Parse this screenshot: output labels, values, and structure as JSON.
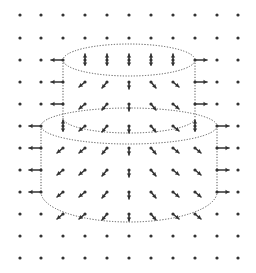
{
  "diagram": {
    "title": "",
    "colors": {
      "ink": "#333333",
      "outline": "#555555",
      "background": "#ffffff"
    },
    "grid": {
      "columns_x": [
        20,
        41,
        63,
        85,
        107,
        129,
        151,
        173,
        195,
        217,
        238
      ],
      "rows_y": [
        15,
        38,
        60,
        82,
        104,
        126,
        148,
        170,
        192,
        214,
        236,
        258
      ],
      "dot_radius": 1.6
    },
    "cylinders": [
      {
        "name": "upper-cylinder",
        "left_x": 63,
        "right_x": 195,
        "top_cy": 60,
        "top_ry": 16,
        "bottom_cy": 118,
        "bottom_ry": 15
      },
      {
        "name": "lower-cylinder",
        "left_x": 41,
        "right_x": 217,
        "top_cy": 126,
        "top_ry": 18,
        "bottom_cy": 192,
        "bottom_ry": 30
      }
    ],
    "arrows": [
      {
        "x": 63,
        "y": 60,
        "dx": -12,
        "dy": 0
      },
      {
        "x": 195,
        "y": 60,
        "dx": 12,
        "dy": 0
      },
      {
        "x": 85,
        "y": 60,
        "dx": 0,
        "dy": -6,
        "double": true
      },
      {
        "x": 107,
        "y": 60,
        "dx": 0,
        "dy": -6,
        "double": true
      },
      {
        "x": 129,
        "y": 60,
        "dx": 0,
        "dy": -6,
        "double": true
      },
      {
        "x": 151,
        "y": 60,
        "dx": 0,
        "dy": -6,
        "double": true
      },
      {
        "x": 173,
        "y": 60,
        "dx": 0,
        "dy": -6,
        "double": true
      },
      {
        "x": 63,
        "y": 82,
        "dx": -12,
        "dy": 0
      },
      {
        "x": 85,
        "y": 82,
        "dx": -6,
        "dy": 5
      },
      {
        "x": 107,
        "y": 82,
        "dx": -5,
        "dy": 6
      },
      {
        "x": 129,
        "y": 82,
        "dx": 0,
        "dy": 7
      },
      {
        "x": 151,
        "y": 82,
        "dx": 5,
        "dy": 6
      },
      {
        "x": 173,
        "y": 82,
        "dx": 6,
        "dy": 5
      },
      {
        "x": 195,
        "y": 82,
        "dx": 12,
        "dy": 0
      },
      {
        "x": 63,
        "y": 104,
        "dx": -12,
        "dy": 0
      },
      {
        "x": 85,
        "y": 104,
        "dx": -6,
        "dy": 5
      },
      {
        "x": 107,
        "y": 104,
        "dx": -5,
        "dy": 6
      },
      {
        "x": 129,
        "y": 104,
        "dx": 0,
        "dy": 7
      },
      {
        "x": 151,
        "y": 104,
        "dx": 5,
        "dy": 6
      },
      {
        "x": 173,
        "y": 104,
        "dx": 6,
        "dy": 5
      },
      {
        "x": 195,
        "y": 104,
        "dx": 12,
        "dy": 0
      },
      {
        "x": 41,
        "y": 126,
        "dx": -12,
        "dy": 0
      },
      {
        "x": 63,
        "y": 126,
        "dx": 0,
        "dy": -6,
        "double": true
      },
      {
        "x": 85,
        "y": 126,
        "dx": -6,
        "dy": 5
      },
      {
        "x": 107,
        "y": 126,
        "dx": -5,
        "dy": 6
      },
      {
        "x": 129,
        "y": 126,
        "dx": 0,
        "dy": 7
      },
      {
        "x": 151,
        "y": 126,
        "dx": 5,
        "dy": 6
      },
      {
        "x": 173,
        "y": 126,
        "dx": 6,
        "dy": 5
      },
      {
        "x": 195,
        "y": 126,
        "dx": 0,
        "dy": -6,
        "double": true
      },
      {
        "x": 217,
        "y": 126,
        "dx": 12,
        "dy": 0
      },
      {
        "x": 41,
        "y": 148,
        "dx": -12,
        "dy": 0
      },
      {
        "x": 63,
        "y": 148,
        "dx": -6,
        "dy": 5
      },
      {
        "x": 85,
        "y": 148,
        "dx": -6,
        "dy": 5
      },
      {
        "x": 107,
        "y": 148,
        "dx": -5,
        "dy": 6
      },
      {
        "x": 129,
        "y": 148,
        "dx": 0,
        "dy": 7
      },
      {
        "x": 151,
        "y": 148,
        "dx": 5,
        "dy": 6
      },
      {
        "x": 173,
        "y": 148,
        "dx": 6,
        "dy": 5
      },
      {
        "x": 195,
        "y": 148,
        "dx": 6,
        "dy": 5
      },
      {
        "x": 217,
        "y": 148,
        "dx": 12,
        "dy": 0
      },
      {
        "x": 41,
        "y": 170,
        "dx": -12,
        "dy": 0
      },
      {
        "x": 63,
        "y": 170,
        "dx": -6,
        "dy": 5
      },
      {
        "x": 85,
        "y": 170,
        "dx": -6,
        "dy": 5
      },
      {
        "x": 107,
        "y": 170,
        "dx": -5,
        "dy": 6
      },
      {
        "x": 129,
        "y": 170,
        "dx": 0,
        "dy": 7
      },
      {
        "x": 151,
        "y": 170,
        "dx": 5,
        "dy": 6
      },
      {
        "x": 173,
        "y": 170,
        "dx": 6,
        "dy": 5
      },
      {
        "x": 195,
        "y": 170,
        "dx": 6,
        "dy": 5
      },
      {
        "x": 217,
        "y": 170,
        "dx": 12,
        "dy": 0
      },
      {
        "x": 41,
        "y": 192,
        "dx": -12,
        "dy": 0
      },
      {
        "x": 63,
        "y": 192,
        "dx": -6,
        "dy": 5
      },
      {
        "x": 85,
        "y": 192,
        "dx": -6,
        "dy": 5
      },
      {
        "x": 107,
        "y": 192,
        "dx": -5,
        "dy": 6
      },
      {
        "x": 129,
        "y": 192,
        "dx": 0,
        "dy": 7
      },
      {
        "x": 151,
        "y": 192,
        "dx": 5,
        "dy": 6
      },
      {
        "x": 173,
        "y": 192,
        "dx": 6,
        "dy": 5
      },
      {
        "x": 195,
        "y": 192,
        "dx": 6,
        "dy": 5
      },
      {
        "x": 217,
        "y": 192,
        "dx": 12,
        "dy": 0
      },
      {
        "x": 63,
        "y": 214,
        "dx": -6,
        "dy": 5
      },
      {
        "x": 85,
        "y": 214,
        "dx": -6,
        "dy": 5
      },
      {
        "x": 107,
        "y": 214,
        "dx": -5,
        "dy": 6
      },
      {
        "x": 129,
        "y": 214,
        "dx": 0,
        "dy": 7
      },
      {
        "x": 151,
        "y": 214,
        "dx": 5,
        "dy": 6
      },
      {
        "x": 173,
        "y": 214,
        "dx": 6,
        "dy": 5
      },
      {
        "x": 195,
        "y": 214,
        "dx": 6,
        "dy": 5
      }
    ]
  }
}
